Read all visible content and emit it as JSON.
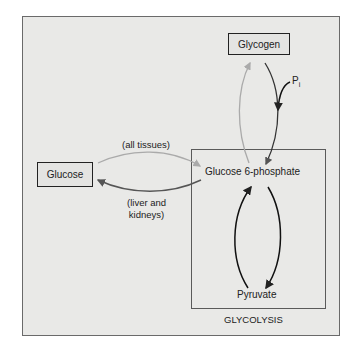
{
  "nodes": {
    "glycogen": "Glycogen",
    "glucose": "Glucose",
    "g6p": "Glucose 6-phosphate",
    "pyruvate": "Pyruvate"
  },
  "labels": {
    "all_tissues": "(all tissues)",
    "liver_line1": "(liver and",
    "liver_line2": "kidneys)",
    "pi": "P",
    "pi_sub": "i",
    "glycolysis": "GLYCOLYSIS"
  },
  "colors": {
    "background": "#e9e9e7",
    "dark_arrow": "#222222",
    "mid_arrow": "#555555",
    "light_arrow": "#a8a8a8"
  }
}
